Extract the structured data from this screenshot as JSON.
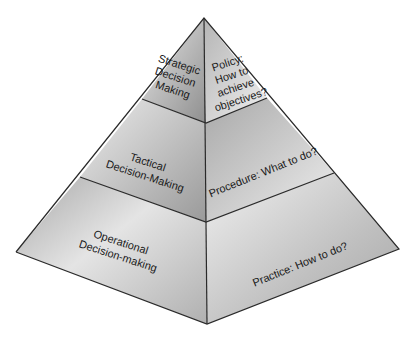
{
  "diagram": {
    "levels": [
      {
        "name": "strategic",
        "left_lines": [
          "Strategic",
          "Decision",
          "Making"
        ],
        "right_lines": [
          "Policy:",
          "How to",
          "achieve",
          "objectives?"
        ]
      },
      {
        "name": "tactical",
        "left_lines": [
          "Tactical",
          "Decision-Making"
        ],
        "right_lines": [
          "Procedure: What to do?"
        ]
      },
      {
        "name": "operational",
        "left_lines": [
          "Operational",
          "Decision-making"
        ],
        "right_lines": [
          "Practice: How to do?"
        ]
      }
    ],
    "colors": {
      "left_light": "#e2e2e2",
      "left_dark": "#9c9c9c",
      "right_light": "#ececec",
      "right_dark": "#a8a8a8",
      "edge": "#2a2a2a"
    }
  }
}
